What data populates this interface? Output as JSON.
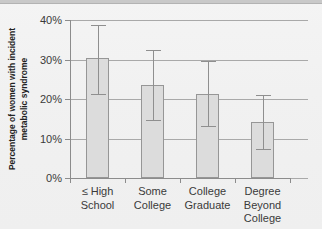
{
  "chart_data": {
    "type": "bar",
    "title": "",
    "xlabel": "",
    "ylabel": "Percentage of women with incident metabolic syndrome",
    "ylabel_line1": "Percentage of women with incident",
    "ylabel_line2": "metabolic syndrome",
    "categories": [
      "≤ High School",
      "Some College",
      "College Graduate",
      "Degree Beyond College"
    ],
    "category_lines": [
      [
        "≤ High",
        "School"
      ],
      [
        "Some",
        "College"
      ],
      [
        "College",
        "Graduate"
      ],
      [
        "Degree",
        "Beyond",
        "College"
      ]
    ],
    "values": [
      30.3,
      23.5,
      21.3,
      14.2
    ],
    "error_low": [
      21.3,
      14.6,
      13.2,
      7.3
    ],
    "error_high": [
      38.8,
      32.5,
      29.7,
      21.0
    ],
    "ylim": [
      0,
      40
    ],
    "ytick_values": [
      0,
      10,
      20,
      30,
      40
    ],
    "ytick_labels": [
      "0%",
      "10%",
      "20%",
      "30%",
      "40%"
    ],
    "grid": true,
    "grid_axis": "y",
    "legend": false,
    "legend_position": "none",
    "bar_color": "#dcdcdc",
    "bar_border_color": "#969696",
    "error_bar_color": "#8f8f8f",
    "axis_color": "#8c8c8c",
    "grid_color": "#a9a9a9",
    "text_color": "#3a3a3a",
    "background_color": "#f1f1f1"
  }
}
